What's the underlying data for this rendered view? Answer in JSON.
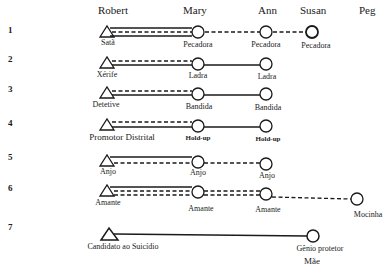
{
  "header": {
    "columns": [
      {
        "name": "Robert",
        "x": 98
      },
      {
        "name": "Mary",
        "x": 183
      },
      {
        "name": "Ann",
        "x": 257
      },
      {
        "name": "Susan",
        "x": 300
      },
      {
        "name": "Peg",
        "x": 358
      }
    ]
  },
  "rows": [
    {
      "number": "1",
      "labels": [
        "Satã",
        "Pecadora",
        "Pecadora",
        "Pecadora"
      ]
    },
    {
      "number": "2",
      "labels": [
        "Xérife",
        "Ladra",
        "Ladra"
      ]
    },
    {
      "number": "3",
      "labels": [
        "Detetive",
        "Bandida",
        "Bandida"
      ]
    },
    {
      "number": "4",
      "labels": [
        "Promotor Distrital",
        "Hold-up",
        "Hold-up"
      ]
    },
    {
      "number": "5",
      "labels": [
        "Anjo",
        "Anjo",
        "Anjo"
      ]
    },
    {
      "number": "6",
      "labels": [
        "Amante",
        "Amante",
        "Amante",
        "Mocinha"
      ]
    },
    {
      "number": "7",
      "labels": [
        "Candidato ao Suicídio",
        "Gênio protetor",
        "Mãe"
      ]
    }
  ],
  "legend_symbols": {
    "triangle": "male character (Robert)",
    "circle": "female character",
    "solid_line": "relationship",
    "dashed_line": "relationship"
  },
  "colors": {
    "ink": "#1a1a1a",
    "paper": "#ffffff"
  }
}
